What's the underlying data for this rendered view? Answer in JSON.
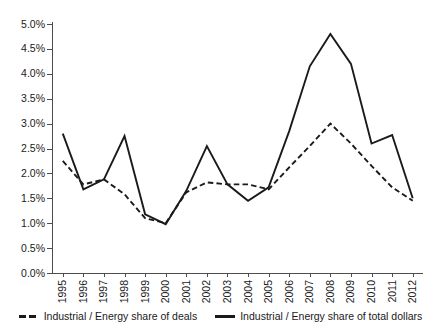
{
  "figure": {
    "clipped_header_text": "",
    "background_color": "#ffffff",
    "line_color": "#1a1a1a"
  },
  "chart_data": {
    "type": "line",
    "title": "",
    "xlabel": "",
    "ylabel": "",
    "ylim": [
      0,
      5
    ],
    "ytick_format": "percent",
    "grid": false,
    "legend_position": "bottom",
    "categories": [
      "1995",
      "1996",
      "1997",
      "1998",
      "1999",
      "2000",
      "2001",
      "2002",
      "2003",
      "2004",
      "2005",
      "2006",
      "2007",
      "2008",
      "2009",
      "2010",
      "2011",
      "2012"
    ],
    "ytick_labels": [
      "0.0%",
      "0.5%",
      "1.0%",
      "1.5%",
      "2.0%",
      "2.5%",
      "3.0%",
      "3.5%",
      "4.0%",
      "4.5%",
      "5.0%"
    ],
    "ytick_values": [
      0,
      0.5,
      1.0,
      1.5,
      2.0,
      2.5,
      3.0,
      3.5,
      4.0,
      4.5,
      5.0
    ],
    "series": [
      {
        "name": "Industrial / Energy share of deals",
        "style": "dashed",
        "color": "#1a1a1a",
        "values": [
          2.25,
          1.78,
          1.88,
          1.58,
          1.1,
          1.0,
          1.62,
          1.82,
          1.78,
          1.78,
          1.68,
          2.12,
          2.55,
          3.0,
          2.6,
          2.15,
          1.72,
          1.45
        ]
      },
      {
        "name": "Industrial / Energy share of total dollars",
        "style": "solid",
        "color": "#1a1a1a",
        "values": [
          2.8,
          1.68,
          1.88,
          2.75,
          1.18,
          0.98,
          1.65,
          2.55,
          1.78,
          1.45,
          1.72,
          2.85,
          4.15,
          4.8,
          4.2,
          2.6,
          2.77,
          1.5
        ]
      }
    ]
  },
  "legend": {
    "entries": [
      {
        "label": "Industrial / Energy share of deals",
        "style": "dashed"
      },
      {
        "label": "Industrial / Energy share of total dollars",
        "style": "solid"
      }
    ]
  }
}
